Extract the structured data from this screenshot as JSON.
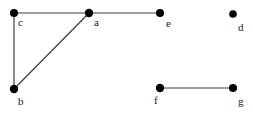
{
  "figure": {
    "kind": "undirected-graph-diagram",
    "width": 253,
    "height": 115,
    "background_color": "#ffffff",
    "edge_color": "#3c3c3c",
    "vertex_color": "#000000",
    "label_color": "#1a1a1a"
  },
  "graph": {
    "vertices": [
      {
        "id": "c",
        "label": "c",
        "cx": 14,
        "cy": 13,
        "r": 4.0,
        "label_x": 18,
        "label_y": 17
      },
      {
        "id": "a",
        "label": "a",
        "cx": 89,
        "cy": 13,
        "r": 4.2,
        "label_x": 94,
        "label_y": 17
      },
      {
        "id": "e",
        "label": "e",
        "cx": 160,
        "cy": 13,
        "r": 4.0,
        "label_x": 166,
        "label_y": 18
      },
      {
        "id": "d",
        "label": "d",
        "cx": 233,
        "cy": 14,
        "r": 3.8,
        "label_x": 238,
        "label_y": 22
      },
      {
        "id": "b",
        "label": "b",
        "cx": 14,
        "cy": 89,
        "r": 4.2,
        "label_x": 18,
        "label_y": 96
      },
      {
        "id": "f",
        "label": "f",
        "cx": 160,
        "cy": 88,
        "r": 4.2,
        "label_x": 154,
        "label_y": 95
      },
      {
        "id": "g",
        "label": "g",
        "cx": 233,
        "cy": 88,
        "r": 4.0,
        "label_x": 238,
        "label_y": 96
      }
    ],
    "edges": [
      {
        "id": "c-a",
        "from": "c",
        "to": "a",
        "x1": 14,
        "y1": 13,
        "x2": 89,
        "y2": 13
      },
      {
        "id": "c-b",
        "from": "c",
        "to": "b",
        "x1": 14,
        "y1": 13,
        "x2": 14,
        "y2": 89
      },
      {
        "id": "b-a",
        "from": "b",
        "to": "a",
        "x1": 14,
        "y1": 89,
        "x2": 89,
        "y2": 13
      },
      {
        "id": "a-e",
        "from": "a",
        "to": "e",
        "x1": 89,
        "y1": 13,
        "x2": 160,
        "y2": 13
      },
      {
        "id": "f-g",
        "from": "f",
        "to": "g",
        "x1": 160,
        "y1": 88,
        "x2": 233,
        "y2": 88
      }
    ],
    "isolated_vertices": [
      "d"
    ]
  }
}
